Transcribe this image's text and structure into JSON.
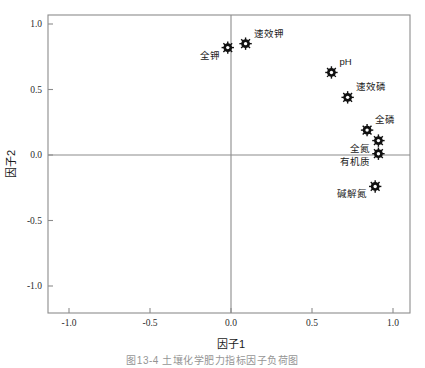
{
  "figure": {
    "caption": "图13-4  土壤化学肥力指标因子负荷图",
    "background_color": "#ffffff",
    "frame_color": "#8c8c8c",
    "marker_color": "#1a1a1a"
  },
  "chart_data": {
    "type": "scatter",
    "title": "",
    "xlabel": "因子1",
    "ylabel": "因子2",
    "xlim": [
      -1.25,
      1.25
    ],
    "ylim": [
      -1.25,
      1.25
    ],
    "xticks": [
      -1.0,
      -0.5,
      0.0,
      0.5,
      1.0
    ],
    "yticks": [
      -1.0,
      -0.5,
      0.0,
      0.5,
      1.0
    ],
    "xtick_labels": [
      "-1.0",
      "-0.5",
      "0.0",
      "0.5",
      "1.0"
    ],
    "ytick_labels": [
      "-1.0",
      "-0.5",
      "0.0",
      "0.5",
      "1.0"
    ],
    "grid": false,
    "zero_lines": true,
    "legend": "none",
    "marker": "star-burst",
    "points": [
      {
        "label": "全钾",
        "x": -0.02,
        "y": 0.82,
        "label_pos": "below-left"
      },
      {
        "label": "速效钾",
        "x": 0.09,
        "y": 0.85,
        "label_pos": "above-right"
      },
      {
        "label": "pH",
        "x": 0.62,
        "y": 0.63,
        "label_pos": "above-right"
      },
      {
        "label": "速效磷",
        "x": 0.72,
        "y": 0.44,
        "label_pos": "above-right"
      },
      {
        "label": "全磷",
        "x": 0.84,
        "y": 0.19,
        "label_pos": "above-right"
      },
      {
        "label": "全氮",
        "x": 0.91,
        "y": 0.11,
        "label_pos": "below-left"
      },
      {
        "label": "有机质",
        "x": 0.91,
        "y": 0.01,
        "label_pos": "below-left"
      },
      {
        "label": "碱解氮",
        "x": 0.89,
        "y": -0.24,
        "label_pos": "below-left"
      }
    ]
  }
}
